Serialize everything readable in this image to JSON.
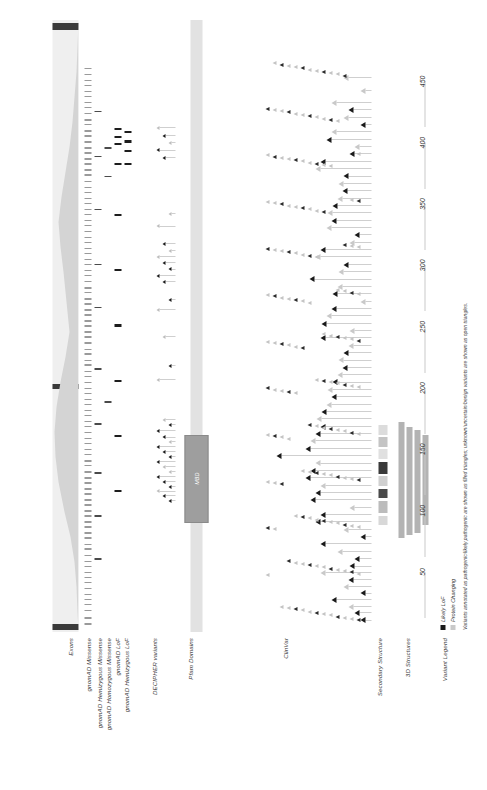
{
  "figure": {
    "orientation": "rotated-90"
  },
  "tracks": [
    {
      "id": "exons",
      "label": "Exons"
    },
    {
      "id": "gnomad_mis",
      "label": "gnomAD Missense"
    },
    {
      "id": "gnomad_hemi_mis",
      "label": "gnomAD Hemizygous Missense"
    },
    {
      "id": "gnomad_homo_mis",
      "label": "gnomAD Homozygous Missense"
    },
    {
      "id": "gnomad_lof",
      "label": "gnomAD LoF"
    },
    {
      "id": "gnomad_hemi_lof",
      "label": "gnomAD Hemizygous LoF"
    },
    {
      "id": "decipher",
      "label": "DECIPHER variants"
    },
    {
      "id": "pfam",
      "label": "Pfam Domains"
    },
    {
      "id": "clinvar",
      "label": "ClinVar"
    },
    {
      "id": "secondary",
      "label": "Secondary Structure"
    },
    {
      "id": "structures3d",
      "label": "3D Structures"
    },
    {
      "id": "legend",
      "label": "Variant Legend"
    }
  ],
  "pfam": {
    "domains": [
      {
        "name": "MBD",
        "start": 90,
        "end": 162
      }
    ]
  },
  "legend": {
    "items": [
      {
        "label": "Likely LoF",
        "color": "#1a1a1a"
      },
      {
        "label": "Protein Changing",
        "color": "#c9c9c9"
      }
    ],
    "caption": "Variants annotated as pathogenic/likely pathogenic are shown as filled triangles; unknown/uncertain/benign variants are shown as open triangles."
  },
  "colors": {
    "filled_triangle": "#1a1a1a",
    "open_triangle": "#c9c9c9",
    "domain_fill": "#9e9e9e",
    "exon_fill": "#efefef",
    "pdb_bar": "#b3b3b3",
    "axis": "#c9c9c9"
  },
  "chart_data": {
    "type": "scatter",
    "xlabel": "Amino acid position",
    "ylabel": "",
    "xlim": [
      1,
      500
    ],
    "grid": false,
    "legend_position": "bottom-left",
    "ticks": [
      50,
      100,
      150,
      200,
      250,
      300,
      350,
      400,
      450
    ],
    "tick_labels": [
      "50",
      "100",
      "150",
      "200",
      "250",
      "300",
      "350",
      "400",
      "450"
    ],
    "series": [
      {
        "name": "gnomAD Missense",
        "type": "tick",
        "x": [
          7,
          12,
          18,
          23,
          27,
          31,
          36,
          41,
          45,
          49,
          54,
          58,
          63,
          68,
          72,
          77,
          81,
          86,
          90,
          95,
          99,
          104,
          108,
          113,
          117,
          122,
          126,
          131,
          136,
          140,
          145,
          149,
          154,
          158,
          163,
          168,
          172,
          177,
          181,
          186,
          190,
          195,
          199,
          204,
          209,
          213,
          218,
          222,
          227,
          231,
          236,
          241,
          245,
          250,
          254,
          259,
          263,
          268,
          272,
          277,
          281,
          286,
          291,
          295,
          300,
          304,
          309,
          313,
          318,
          322,
          327,
          332,
          336,
          341,
          345,
          350,
          354,
          359,
          363,
          368,
          373,
          377,
          382,
          386,
          391,
          395,
          400,
          405,
          409,
          414,
          418,
          423,
          428,
          432,
          437,
          441,
          446,
          450,
          455,
          460
        ]
      },
      {
        "name": "gnomAD Hemizygous Missense",
        "type": "tick",
        "x": [
          60,
          95,
          130,
          170,
          215,
          265,
          300,
          345,
          388,
          425
        ]
      },
      {
        "name": "gnomAD Homozygous Missense",
        "type": "tick",
        "x": [
          188,
          372,
          395
        ]
      },
      {
        "name": "gnomAD LoF",
        "type": "tick",
        "x": [
          115,
          160,
          205,
          250,
          295,
          340,
          382,
          398,
          404,
          410
        ]
      },
      {
        "name": "gnomAD Hemizygous LoF",
        "type": "tick",
        "x": [
          382,
          392,
          400,
          408
        ]
      },
      {
        "name": "DECIPHER variants",
        "type": "triangle",
        "points": [
          {
            "x": 106,
            "filled": true
          },
          {
            "x": 110,
            "filled": true
          },
          {
            "x": 114,
            "filled": false
          },
          {
            "x": 118,
            "filled": true
          },
          {
            "x": 122,
            "filled": true
          },
          {
            "x": 126,
            "filled": true
          },
          {
            "x": 130,
            "filled": false
          },
          {
            "x": 134,
            "filled": false
          },
          {
            "x": 138,
            "filled": true
          },
          {
            "x": 142,
            "filled": true
          },
          {
            "x": 146,
            "filled": true
          },
          {
            "x": 150,
            "filled": true
          },
          {
            "x": 154,
            "filled": false
          },
          {
            "x": 158,
            "filled": true
          },
          {
            "x": 163,
            "filled": true
          },
          {
            "x": 168,
            "filled": true
          },
          {
            "x": 172,
            "filled": false
          },
          {
            "x": 205,
            "filled": false
          },
          {
            "x": 216,
            "filled": true
          },
          {
            "x": 240,
            "filled": false
          },
          {
            "x": 262,
            "filled": false
          },
          {
            "x": 270,
            "filled": true
          },
          {
            "x": 285,
            "filled": true
          },
          {
            "x": 290,
            "filled": true
          },
          {
            "x": 295,
            "filled": true
          },
          {
            "x": 300,
            "filled": true
          },
          {
            "x": 305,
            "filled": false
          },
          {
            "x": 310,
            "filled": false
          },
          {
            "x": 316,
            "filled": true
          },
          {
            "x": 330,
            "filled": false
          },
          {
            "x": 340,
            "filled": false
          },
          {
            "x": 386,
            "filled": true
          },
          {
            "x": 392,
            "filled": true
          },
          {
            "x": 398,
            "filled": false
          },
          {
            "x": 404,
            "filled": true
          },
          {
            "x": 410,
            "filled": false
          }
        ]
      },
      {
        "name": "ClinVar",
        "type": "triangle",
        "points": [
          {
            "x": 8,
            "filled": true,
            "stack": 0
          },
          {
            "x": 14,
            "filled": true,
            "stack": 0
          },
          {
            "x": 19,
            "filled": false,
            "stack": 0
          },
          {
            "x": 25,
            "filled": true,
            "stack": 1
          },
          {
            "x": 30,
            "filled": true,
            "stack": 0
          },
          {
            "x": 35,
            "filled": false,
            "stack": 1
          },
          {
            "x": 41,
            "filled": true,
            "stack": 0
          },
          {
            "x": 47,
            "filled": false,
            "stack": 2
          },
          {
            "x": 52,
            "filled": true,
            "stack": 1
          },
          {
            "x": 58,
            "filled": true,
            "stack": 0
          },
          {
            "x": 64,
            "filled": false,
            "stack": 1
          },
          {
            "x": 70,
            "filled": true,
            "stack": 2
          },
          {
            "x": 76,
            "filled": true,
            "stack": 0
          },
          {
            "x": 82,
            "filled": false,
            "stack": 1
          },
          {
            "x": 88,
            "filled": true,
            "stack": 3
          },
          {
            "x": 94,
            "filled": true,
            "stack": 2
          },
          {
            "x": 100,
            "filled": false,
            "stack": 1
          },
          {
            "x": 106,
            "filled": true,
            "stack": 4
          },
          {
            "x": 112,
            "filled": true,
            "stack": 3
          },
          {
            "x": 118,
            "filled": false,
            "stack": 2
          },
          {
            "x": 124,
            "filled": true,
            "stack": 5
          },
          {
            "x": 130,
            "filled": true,
            "stack": 4
          },
          {
            "x": 136,
            "filled": false,
            "stack": 3
          },
          {
            "x": 142,
            "filled": true,
            "stack": 6
          },
          {
            "x": 148,
            "filled": true,
            "stack": 5
          },
          {
            "x": 154,
            "filled": false,
            "stack": 4
          },
          {
            "x": 160,
            "filled": true,
            "stack": 3
          },
          {
            "x": 166,
            "filled": true,
            "stack": 2
          },
          {
            "x": 172,
            "filled": false,
            "stack": 4
          },
          {
            "x": 178,
            "filled": true,
            "stack": 3
          },
          {
            "x": 184,
            "filled": false,
            "stack": 2
          },
          {
            "x": 190,
            "filled": true,
            "stack": 1
          },
          {
            "x": 196,
            "filled": false,
            "stack": 3
          },
          {
            "x": 202,
            "filled": true,
            "stack": 2
          },
          {
            "x": 208,
            "filled": false,
            "stack": 1
          },
          {
            "x": 214,
            "filled": true,
            "stack": 0
          },
          {
            "x": 220,
            "filled": false,
            "stack": 2
          },
          {
            "x": 226,
            "filled": true,
            "stack": 1
          },
          {
            "x": 232,
            "filled": false,
            "stack": 0
          },
          {
            "x": 238,
            "filled": true,
            "stack": 2
          },
          {
            "x": 244,
            "filled": false,
            "stack": 1
          },
          {
            "x": 250,
            "filled": true,
            "stack": 3
          },
          {
            "x": 256,
            "filled": false,
            "stack": 2
          },
          {
            "x": 262,
            "filled": true,
            "stack": 1
          },
          {
            "x": 268,
            "filled": false,
            "stack": 0
          },
          {
            "x": 274,
            "filled": true,
            "stack": 2
          },
          {
            "x": 280,
            "filled": false,
            "stack": 1
          },
          {
            "x": 286,
            "filled": true,
            "stack": 3
          },
          {
            "x": 292,
            "filled": false,
            "stack": 2
          },
          {
            "x": 298,
            "filled": true,
            "stack": 1
          },
          {
            "x": 304,
            "filled": false,
            "stack": 3
          },
          {
            "x": 310,
            "filled": true,
            "stack": 2
          },
          {
            "x": 316,
            "filled": false,
            "stack": 1
          },
          {
            "x": 322,
            "filled": true,
            "stack": 0
          },
          {
            "x": 328,
            "filled": false,
            "stack": 2
          },
          {
            "x": 334,
            "filled": true,
            "stack": 1
          },
          {
            "x": 340,
            "filled": false,
            "stack": 3
          },
          {
            "x": 346,
            "filled": true,
            "stack": 2
          },
          {
            "x": 352,
            "filled": false,
            "stack": 1
          },
          {
            "x": 358,
            "filled": true,
            "stack": 0
          },
          {
            "x": 364,
            "filled": false,
            "stack": 2
          },
          {
            "x": 370,
            "filled": true,
            "stack": 1
          },
          {
            "x": 376,
            "filled": false,
            "stack": 3
          },
          {
            "x": 382,
            "filled": true,
            "stack": 2
          },
          {
            "x": 388,
            "filled": true,
            "stack": 1
          },
          {
            "x": 394,
            "filled": false,
            "stack": 0
          },
          {
            "x": 400,
            "filled": true,
            "stack": 2
          },
          {
            "x": 406,
            "filled": false,
            "stack": 1
          },
          {
            "x": 412,
            "filled": true,
            "stack": 0
          },
          {
            "x": 418,
            "filled": false,
            "stack": 1
          },
          {
            "x": 424,
            "filled": true,
            "stack": 0
          },
          {
            "x": 430,
            "filled": false,
            "stack": 1
          },
          {
            "x": 440,
            "filled": false,
            "stack": 0
          },
          {
            "x": 450,
            "filled": false,
            "stack": 1
          }
        ]
      },
      {
        "name": "3D Structures",
        "type": "bar",
        "bars": [
          {
            "start": 78,
            "end": 172
          },
          {
            "start": 80,
            "end": 168
          },
          {
            "start": 82,
            "end": 166
          },
          {
            "start": 88,
            "end": 162
          }
        ]
      },
      {
        "name": "Secondary Structure",
        "type": "segments",
        "segments": [
          {
            "start": 88,
            "end": 96,
            "shade": "#d8d8d8"
          },
          {
            "start": 98,
            "end": 108,
            "shade": "#bcbcbc"
          },
          {
            "start": 110,
            "end": 118,
            "shade": "#4a4a4a"
          },
          {
            "start": 120,
            "end": 128,
            "shade": "#d0d0d0"
          },
          {
            "start": 130,
            "end": 140,
            "shade": "#3a3a3a"
          },
          {
            "start": 142,
            "end": 150,
            "shade": "#e0e0e0"
          },
          {
            "start": 152,
            "end": 160,
            "shade": "#c4c4c4"
          },
          {
            "start": 162,
            "end": 170,
            "shade": "#dcdcdc"
          }
        ]
      }
    ]
  }
}
